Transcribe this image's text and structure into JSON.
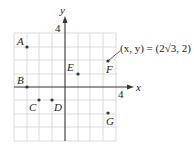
{
  "diagram": {
    "type": "coordinate-plane",
    "axes": {
      "x_label": "x",
      "y_label": "y",
      "x_tick_label": "4",
      "y_tick_label": "4",
      "x_range": [
        -4,
        4
      ],
      "y_range": [
        -4,
        4
      ]
    },
    "points": [
      {
        "label": "A",
        "x": -3,
        "y": 3
      },
      {
        "label": "B",
        "x": -3,
        "y": 0
      },
      {
        "label": "C",
        "x": -2,
        "y": -1
      },
      {
        "label": "D",
        "x": -1,
        "y": -1
      },
      {
        "label": "E",
        "x": 1,
        "y": 1
      },
      {
        "label": "F",
        "x": 3.46,
        "y": 2
      },
      {
        "label": "G",
        "x": 3.46,
        "y": -2
      }
    ],
    "annotation": "(x, y) = (2√3, 2)",
    "colors": {
      "grid": "#d0d0d0",
      "axis": "#333333",
      "point": "#333333"
    }
  }
}
